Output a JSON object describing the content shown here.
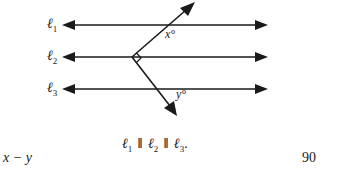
{
  "diagram": {
    "lines": [
      {
        "name": "l1",
        "symbol": "ℓ",
        "subscript": "1",
        "y": 25
      },
      {
        "name": "l2",
        "symbol": "ℓ",
        "subscript": "2",
        "y": 57
      },
      {
        "name": "l3",
        "symbol": "ℓ",
        "subscript": "3",
        "y": 89
      }
    ],
    "angle_labels": {
      "x": "x°",
      "y": "y°"
    },
    "right_angle_marker": true,
    "caption": {
      "parts": [
        "ℓ",
        "1",
        "ℓ",
        "2",
        "ℓ",
        "3"
      ],
      "parallel_symbol": "‖",
      "end": "."
    }
  },
  "question": {
    "quantity_a": "x − y",
    "quantity_b": "90"
  }
}
